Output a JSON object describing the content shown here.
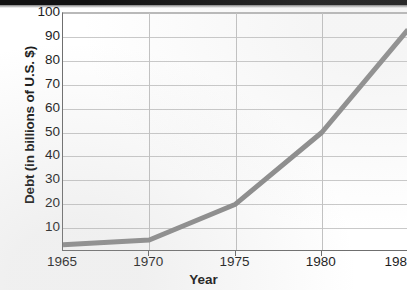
{
  "chart_data": {
    "type": "line",
    "title": "",
    "xlabel": "Year",
    "ylabel": "Debt (in billions of U.S. $)",
    "x": [
      1965,
      1970,
      1975,
      1980,
      1985
    ],
    "values": [
      3,
      5,
      20,
      50,
      93
    ],
    "series": [
      {
        "name": "Debt",
        "values": [
          3,
          5,
          20,
          50,
          93
        ]
      }
    ],
    "xlim": [
      1965,
      1985
    ],
    "ylim": [
      0,
      100
    ],
    "xticks": [
      1965,
      1970,
      1975,
      1980,
      1985
    ],
    "xtick_labels": [
      "1965",
      "1970",
      "1975",
      "1980",
      "198"
    ],
    "yticks": [
      10,
      20,
      30,
      40,
      50,
      60,
      70,
      80,
      90,
      100
    ],
    "ytick_labels": [
      "10",
      "20",
      "30",
      "40",
      "50",
      "60",
      "70",
      "80",
      "90",
      "100"
    ],
    "grid": "horizontal-and-vertical",
    "legend": "none",
    "line_color": "#8c8c8c",
    "grid_color": "#c9c9c9",
    "axis_color": "#6f6f6f",
    "text_color": "#1d1d1d",
    "note": "Right edge of plot is cropped; last x tick label truncated to 198"
  }
}
